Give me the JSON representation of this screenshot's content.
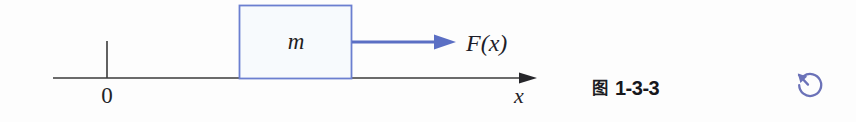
{
  "figure": {
    "axis": {
      "label": "x",
      "origin_label": "0",
      "color": "#3a3a3a",
      "start_x": 53,
      "end_x": 537,
      "y": 78,
      "tick_x": 107,
      "tick_top_y": 41
    },
    "block": {
      "mass_label": "m",
      "border_color": "#6b7fd0",
      "fill_color": "#f7fafd",
      "left": 239,
      "top": 5,
      "right": 352,
      "bottom": 79
    },
    "force_arrow": {
      "label": "F(x)",
      "color": "#5b6fc4",
      "start_x": 352,
      "end_x": 455,
      "y": 42
    }
  },
  "caption": {
    "figure_glyph": "图",
    "number": "1-3-3"
  },
  "toolbar": {
    "rotate_label": "rotate-counterclockwise",
    "rotate_color": "#6b72b8"
  }
}
